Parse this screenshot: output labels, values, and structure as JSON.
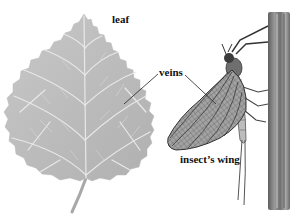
{
  "figure": {
    "type": "illustration",
    "labels": {
      "leaf": "leaf",
      "veins": "veins",
      "wing": "insect’s wing"
    },
    "colors": {
      "background": "#ffffff",
      "leaf_fill": "#bdbdbd",
      "leaf_vein": "#e6e6e6",
      "wing_fill": "#9a9a9a",
      "wing_vein": "#3a3a3a",
      "pole": "#7a7a7a",
      "leader_line": "#222222",
      "label_text": "#111111"
    }
  }
}
